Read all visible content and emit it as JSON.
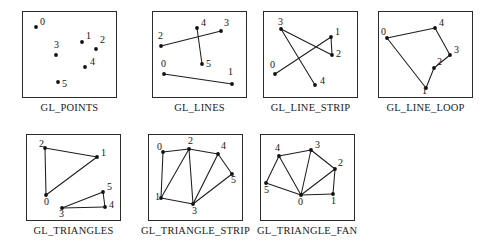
{
  "figure": {
    "panel_width": 95,
    "panel_height": 87,
    "dot_radius": 1.9,
    "line_color": "#1d1d1d",
    "dot_color": "#111111",
    "border_color": "#2b2b2b",
    "background": "#ffffff"
  },
  "panels": [
    {
      "id": "gl-points",
      "caption": "GL_POINTS",
      "left": 22,
      "top": 11,
      "vertices": [
        {
          "label": "0",
          "x": 13,
          "y": 15,
          "lx": 17,
          "ly": 13
        },
        {
          "label": "1",
          "x": 59,
          "y": 30,
          "lx": 63,
          "ly": 27
        },
        {
          "label": "2",
          "x": 73,
          "y": 37,
          "lx": 77,
          "ly": 31
        },
        {
          "label": "3",
          "x": 33,
          "y": 43,
          "lx": 31,
          "ly": 36
        },
        {
          "label": "4",
          "x": 62,
          "y": 55,
          "lx": 67,
          "ly": 53
        },
        {
          "label": "5",
          "x": 35,
          "y": 70,
          "lx": 39,
          "ly": 75
        }
      ],
      "edges": []
    },
    {
      "id": "gl-lines",
      "caption": "GL_LINES",
      "left": 152,
      "top": 11,
      "vertices": [
        {
          "label": "0",
          "x": 11,
          "y": 62,
          "lx": 8,
          "ly": 55
        },
        {
          "label": "1",
          "x": 79,
          "y": 72,
          "lx": 75,
          "ly": 63
        },
        {
          "label": "2",
          "x": 8,
          "y": 34,
          "lx": 5,
          "ly": 27
        },
        {
          "label": "3",
          "x": 68,
          "y": 19,
          "lx": 71,
          "ly": 14
        },
        {
          "label": "4",
          "x": 44,
          "y": 16,
          "lx": 48,
          "ly": 14
        },
        {
          "label": "5",
          "x": 49,
          "y": 52,
          "lx": 53,
          "ly": 55
        }
      ],
      "edges": [
        {
          "from": 0,
          "to": 1
        },
        {
          "from": 2,
          "to": 3
        },
        {
          "from": 4,
          "to": 5
        }
      ]
    },
    {
      "id": "gl-line-strip",
      "caption": "GL_LINE_STRIP",
      "left": 263,
      "top": 11,
      "vertices": [
        {
          "label": "0",
          "x": 11,
          "y": 62,
          "lx": 6,
          "ly": 56
        },
        {
          "label": "1",
          "x": 67,
          "y": 25,
          "lx": 71,
          "ly": 23
        },
        {
          "label": "2",
          "x": 68,
          "y": 43,
          "lx": 72,
          "ly": 45
        },
        {
          "label": "3",
          "x": 17,
          "y": 17,
          "lx": 14,
          "ly": 13
        },
        {
          "label": "4",
          "x": 51,
          "y": 73,
          "lx": 56,
          "ly": 72
        }
      ],
      "edges": [
        {
          "from": 0,
          "to": 1
        },
        {
          "from": 1,
          "to": 2
        },
        {
          "from": 2,
          "to": 3
        },
        {
          "from": 3,
          "to": 4
        }
      ]
    },
    {
      "id": "gl-line-loop",
      "caption": "GL_LINE_LOOP",
      "left": 378,
      "top": 11,
      "vertices": [
        {
          "label": "0",
          "x": 8,
          "y": 26,
          "lx": 2,
          "ly": 23
        },
        {
          "label": "1",
          "x": 47,
          "y": 76,
          "lx": 43,
          "ly": 82
        },
        {
          "label": "2",
          "x": 55,
          "y": 56,
          "lx": 58,
          "ly": 53
        },
        {
          "label": "3",
          "x": 71,
          "y": 43,
          "lx": 75,
          "ly": 41
        },
        {
          "label": "4",
          "x": 56,
          "y": 16,
          "lx": 60,
          "ly": 14
        }
      ],
      "edges": [
        {
          "from": 0,
          "to": 4
        },
        {
          "from": 4,
          "to": 3
        },
        {
          "from": 3,
          "to": 2
        },
        {
          "from": 2,
          "to": 1
        },
        {
          "from": 1,
          "to": 0
        }
      ]
    },
    {
      "id": "gl-triangles",
      "caption": "GL_TRIANGLES",
      "left": 26,
      "top": 134,
      "vertices": [
        {
          "label": "0",
          "x": 19,
          "y": 60,
          "lx": 17,
          "ly": 70
        },
        {
          "label": "1",
          "x": 70,
          "y": 22,
          "lx": 74,
          "ly": 21
        },
        {
          "label": "2",
          "x": 18,
          "y": 13,
          "lx": 12,
          "ly": 12
        },
        {
          "label": "3",
          "x": 35,
          "y": 73,
          "lx": 32,
          "ly": 82
        },
        {
          "label": "4",
          "x": 78,
          "y": 72,
          "lx": 82,
          "ly": 73
        },
        {
          "label": "5",
          "x": 76,
          "y": 57,
          "lx": 80,
          "ly": 55
        }
      ],
      "edges": [
        {
          "from": 0,
          "to": 1
        },
        {
          "from": 1,
          "to": 2
        },
        {
          "from": 2,
          "to": 0
        },
        {
          "from": 3,
          "to": 4
        },
        {
          "from": 4,
          "to": 5
        },
        {
          "from": 5,
          "to": 3
        }
      ]
    },
    {
      "id": "gl-triangle-strip",
      "caption": "GL_TRIANGLE_STRIP",
      "left": 141,
      "top": 134,
      "vertices": [
        {
          "label": "0",
          "x": 14,
          "y": 17,
          "lx": 8,
          "ly": 15
        },
        {
          "label": "1",
          "x": 12,
          "y": 63,
          "lx": 6,
          "ly": 65
        },
        {
          "label": "2",
          "x": 40,
          "y": 14,
          "lx": 39,
          "ly": 9
        },
        {
          "label": "3",
          "x": 44,
          "y": 69,
          "lx": 43,
          "ly": 79
        },
        {
          "label": "4",
          "x": 69,
          "y": 19,
          "lx": 72,
          "ly": 14
        },
        {
          "label": "5",
          "x": 83,
          "y": 39,
          "lx": 82,
          "ly": 48
        }
      ],
      "edges": [
        {
          "from": 0,
          "to": 1
        },
        {
          "from": 0,
          "to": 2
        },
        {
          "from": 1,
          "to": 2
        },
        {
          "from": 1,
          "to": 3
        },
        {
          "from": 2,
          "to": 3
        },
        {
          "from": 2,
          "to": 4
        },
        {
          "from": 3,
          "to": 4
        },
        {
          "from": 3,
          "to": 5
        },
        {
          "from": 4,
          "to": 5
        }
      ]
    },
    {
      "id": "gl-triangle-fan",
      "caption": "GL_TRIANGLE_FAN",
      "left": 257,
      "top": 134,
      "vertices": [
        {
          "label": "0",
          "x": 40,
          "y": 60,
          "lx": 37,
          "ly": 70
        },
        {
          "label": "1",
          "x": 72,
          "y": 59,
          "lx": 70,
          "ly": 69
        },
        {
          "label": "2",
          "x": 74,
          "y": 34,
          "lx": 77,
          "ly": 31
        },
        {
          "label": "3",
          "x": 50,
          "y": 15,
          "lx": 54,
          "ly": 13
        },
        {
          "label": "4",
          "x": 18,
          "y": 21,
          "lx": 14,
          "ly": 16
        },
        {
          "label": "5",
          "x": 5,
          "y": 48,
          "lx": 3,
          "ly": 58
        }
      ],
      "edges": [
        {
          "from": 0,
          "to": 1
        },
        {
          "from": 0,
          "to": 2
        },
        {
          "from": 0,
          "to": 3
        },
        {
          "from": 0,
          "to": 4
        },
        {
          "from": 0,
          "to": 5
        },
        {
          "from": 1,
          "to": 2
        },
        {
          "from": 2,
          "to": 3
        },
        {
          "from": 3,
          "to": 4
        },
        {
          "from": 4,
          "to": 5
        }
      ]
    }
  ]
}
